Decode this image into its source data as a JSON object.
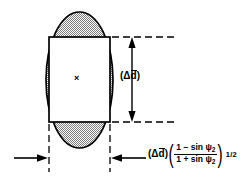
{
  "figure": {
    "background_color": "#ffffff",
    "stroke_color": "#000000",
    "hatch_fill_color": "#b0b0b0",
    "inner_fill_color": "#ffffff",
    "center_marker": "×",
    "center_marker_name": "center-point-mark"
  },
  "geometry": {
    "ellipse": {
      "cx": 79.5,
      "cy": 80,
      "rx": 33.5,
      "ry": 68,
      "stroke_width": 1.6
    },
    "rectangle": {
      "x": 49,
      "y": 37,
      "width": 61,
      "height": 85,
      "stroke_width": 1.6
    },
    "vertical_dimension": {
      "x": 132,
      "y_top": 37,
      "y_bottom": 122
    },
    "horizontal_dimension": {
      "y": 158,
      "left_tick_x": 49,
      "right_tick_x": 110
    },
    "dashed_extensions": {
      "top_y": 37,
      "bottom_y": 122,
      "right_end_x": 175,
      "left_vertical_x": 49,
      "right_vertical_x": 110,
      "vertical_bottom_y": 170
    }
  },
  "labels": {
    "vertical_dimension": {
      "name": "delta-d-bar-label",
      "open_paren": "(",
      "delta": "Δ",
      "variable": "d",
      "close_paren": ")",
      "plain_text": "(Δd̄)"
    },
    "formula": {
      "name": "projected-width-formula",
      "open_paren": "(",
      "delta": "Δ",
      "variable": "d",
      "close_paren": ")",
      "numerator_lead": "1 − sin ",
      "numerator_symbol": "ψ",
      "numerator_subscript": "2",
      "denominator_lead": "1 + sin ",
      "denominator_symbol": "ψ",
      "denominator_subscript": "2",
      "exponent": "1/2",
      "plain_text": "(Δd̄) ( (1 − sin ψ₂) / (1 + sin ψ₂) )^(1/2)"
    }
  }
}
